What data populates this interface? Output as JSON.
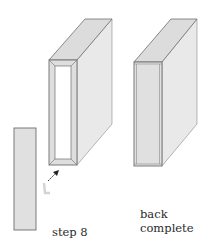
{
  "figure": {
    "step_label": "step 8",
    "complete_label_line1": "back",
    "complete_label_line2": "complete"
  },
  "colors": {
    "face": "#e2e2e2",
    "side": "#e9e9e9",
    "top": "#dcdcdc",
    "stroke": "#6e6e6e",
    "inner": "#ffffff",
    "arrow": "#222222"
  }
}
